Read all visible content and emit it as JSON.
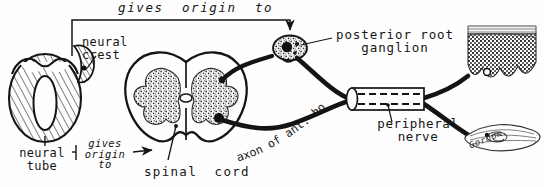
{
  "figure": {
    "signature": "Gordon.",
    "ink_color": "#151515",
    "background_color": "#fefefe",
    "stipple_color": "#2b2b2b"
  },
  "labels": {
    "gives_origin_to_top": "gives  origin  to",
    "neural_crest": "neural\ncrest",
    "posterior_root_ganglion": "posterior root\nganglion",
    "neural_tube": "neural\ntube",
    "gives_origin_to_bottom": "gives\norigin\nto",
    "spinal_cord": "spinal  cord",
    "axon_of_ant_horn_cell": "axon of ant. horn cell",
    "peripheral_nerve": "peripheral\nnerve"
  },
  "structures": [
    {
      "name": "neural-tube",
      "description": "hatched oval with central lumen",
      "position": "left"
    },
    {
      "name": "neural-crest",
      "description": "small hatched crescent with dark cell",
      "position": "left-upper"
    },
    {
      "name": "spinal-cord",
      "description": "transverse section, butterfly stippled grey matter",
      "position": "center"
    },
    {
      "name": "posterior-root-ganglion",
      "description": "stippled oval with dark sensory neuron",
      "position": "upper-center-right"
    },
    {
      "name": "peripheral-nerve",
      "description": "cut cylinder with dashed internal fibres",
      "position": "right-center"
    },
    {
      "name": "skin",
      "description": "epidermis section with dermal papillae, sensory ending",
      "position": "upper-right"
    },
    {
      "name": "muscle",
      "description": "spindle-shaped striated muscle with motor end plate",
      "position": "lower-right"
    }
  ],
  "connectors": [
    {
      "name": "bracket-crest-to-ganglion",
      "from": "neural-crest",
      "to": "posterior-root-ganglion",
      "label": "gives  origin  to"
    },
    {
      "name": "arrow-tube-to-cord",
      "from": "neural-tube",
      "to": "spinal-cord",
      "label": "gives origin to"
    },
    {
      "name": "sensory-fibre",
      "from": "posterior-root-ganglion",
      "to": "skin"
    },
    {
      "name": "motor-fibre",
      "from": "spinal-cord-anterior-horn",
      "to": "muscle"
    }
  ]
}
